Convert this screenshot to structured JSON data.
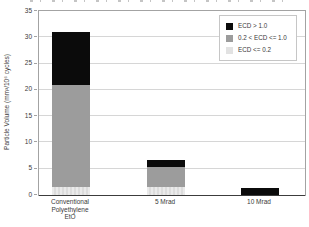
{
  "colors": {
    "background": "#ffffff",
    "grid": "#d6d6d6",
    "frame": "#a3a3a3",
    "axis": "#3c3c3c",
    "text": "#3a3a3a",
    "legend_border": "#c6c6c6"
  },
  "chart_data": {
    "type": "bar",
    "stacked": true,
    "title": "",
    "xlabel": "",
    "ylabel": "Particle Volume (mm³/10⁶ cycles)",
    "categories": [
      "Conventional\nPolyethylene\nEtO",
      "5 Mrad",
      "10 Mrad"
    ],
    "series": [
      {
        "name": "ECD <= 0.2",
        "color": "#e2e2e2",
        "pattern": "vstripes",
        "values": [
          1.5,
          1.5,
          0
        ]
      },
      {
        "name": "0.2 < ECD <= 1.0",
        "color": "#9c9c9c",
        "pattern": "solid",
        "values": [
          19.5,
          3.9,
          0
        ]
      },
      {
        "name": "ECD > 1.0",
        "color": "#0b0b0b",
        "pattern": "solid",
        "values": [
          10.0,
          1.3,
          1.3
        ]
      }
    ],
    "totals": [
      31.0,
      6.7,
      1.3
    ],
    "ylim": [
      0,
      35
    ],
    "yticks": [
      0,
      5,
      10,
      15,
      20,
      25,
      30,
      35
    ],
    "grid": true,
    "legend": {
      "position": "upper right",
      "entries": [
        "ECD > 1.0",
        "0.2 < ECD <= 1.0",
        "ECD <= 0.2"
      ]
    }
  }
}
